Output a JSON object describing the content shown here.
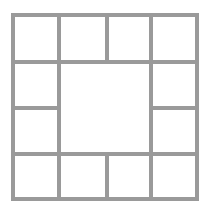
{
  "figure": {
    "type": "line-diagram",
    "background_color": "#ffffff",
    "line_color": "#9a9a9a",
    "line_width_px": 4,
    "canvas": {
      "width": 210,
      "height": 214
    }
  },
  "chart_data": {
    "type": "diagram",
    "xlabel": "",
    "ylabel": "",
    "bounds": {
      "x0": 11,
      "y0": 13,
      "x1": 199,
      "y1": 201
    },
    "vertical_divider_x": [
      57,
      105,
      149
    ],
    "horizontal_divider_y": [
      60,
      106,
      152
    ],
    "cell_count": 12,
    "cells": [
      {
        "id": "cell-r1c1",
        "label": "",
        "x": 11,
        "y": 13,
        "w": 50,
        "h": 51
      },
      {
        "id": "cell-r1c2",
        "label": "",
        "x": 57,
        "y": 13,
        "w": 52,
        "h": 51
      },
      {
        "id": "cell-r1c3",
        "label": "",
        "x": 105,
        "y": 13,
        "w": 48,
        "h": 51
      },
      {
        "id": "cell-r1c4",
        "label": "",
        "x": 149,
        "y": 13,
        "w": 50,
        "h": 51
      },
      {
        "id": "cell-r2c1",
        "label": "",
        "x": 11,
        "y": 60,
        "w": 50,
        "h": 50
      },
      {
        "id": "cell-r3c1",
        "label": "",
        "x": 11,
        "y": 106,
        "w": 50,
        "h": 50
      },
      {
        "id": "cell-center",
        "label": "",
        "x": 57,
        "y": 60,
        "w": 96,
        "h": 96
      },
      {
        "id": "cell-r2c4",
        "label": "",
        "x": 149,
        "y": 60,
        "w": 50,
        "h": 50
      },
      {
        "id": "cell-r3c4",
        "label": "",
        "x": 149,
        "y": 106,
        "w": 50,
        "h": 50
      },
      {
        "id": "cell-r4c1",
        "label": "",
        "x": 11,
        "y": 152,
        "w": 50,
        "h": 49
      },
      {
        "id": "cell-r4c2",
        "label": "",
        "x": 57,
        "y": 152,
        "w": 52,
        "h": 49
      },
      {
        "id": "cell-r4c3",
        "label": "",
        "x": 105,
        "y": 152,
        "w": 48,
        "h": 49
      },
      {
        "id": "cell-r4c4",
        "label": "",
        "x": 149,
        "y": 152,
        "w": 50,
        "h": 49
      }
    ],
    "segments": [
      {
        "id": "border-top",
        "orientation": "h",
        "x": 11,
        "y": 13,
        "length": 188
      },
      {
        "id": "border-bottom",
        "orientation": "h",
        "x": 11,
        "y": 197,
        "length": 188
      },
      {
        "id": "border-left",
        "orientation": "v",
        "x": 11,
        "y": 13,
        "length": 188
      },
      {
        "id": "border-right",
        "orientation": "v",
        "x": 195,
        "y": 13,
        "length": 188
      },
      {
        "id": "divider-h-upper",
        "orientation": "h",
        "x": 11,
        "y": 60,
        "length": 188
      },
      {
        "id": "divider-h-lower",
        "orientation": "h",
        "x": 11,
        "y": 152,
        "length": 188
      },
      {
        "id": "divider-h-mid-left",
        "orientation": "h",
        "x": 11,
        "y": 106,
        "length": 50
      },
      {
        "id": "divider-h-mid-right",
        "orientation": "h",
        "x": 149,
        "y": 106,
        "length": 50
      },
      {
        "id": "divider-v-top-1",
        "orientation": "v",
        "x": 57,
        "y": 13,
        "length": 51
      },
      {
        "id": "divider-v-top-2",
        "orientation": "v",
        "x": 105,
        "y": 13,
        "length": 51
      },
      {
        "id": "divider-v-top-3",
        "orientation": "v",
        "x": 149,
        "y": 13,
        "length": 51
      },
      {
        "id": "divider-v-mid-left",
        "orientation": "v",
        "x": 57,
        "y": 60,
        "length": 96
      },
      {
        "id": "divider-v-mid-right",
        "orientation": "v",
        "x": 149,
        "y": 60,
        "length": 96
      },
      {
        "id": "divider-v-bottom-1",
        "orientation": "v",
        "x": 57,
        "y": 152,
        "length": 49
      },
      {
        "id": "divider-v-bottom-2",
        "orientation": "v",
        "x": 105,
        "y": 152,
        "length": 49
      },
      {
        "id": "divider-v-bottom-3",
        "orientation": "v",
        "x": 149,
        "y": 152,
        "length": 49
      }
    ]
  }
}
